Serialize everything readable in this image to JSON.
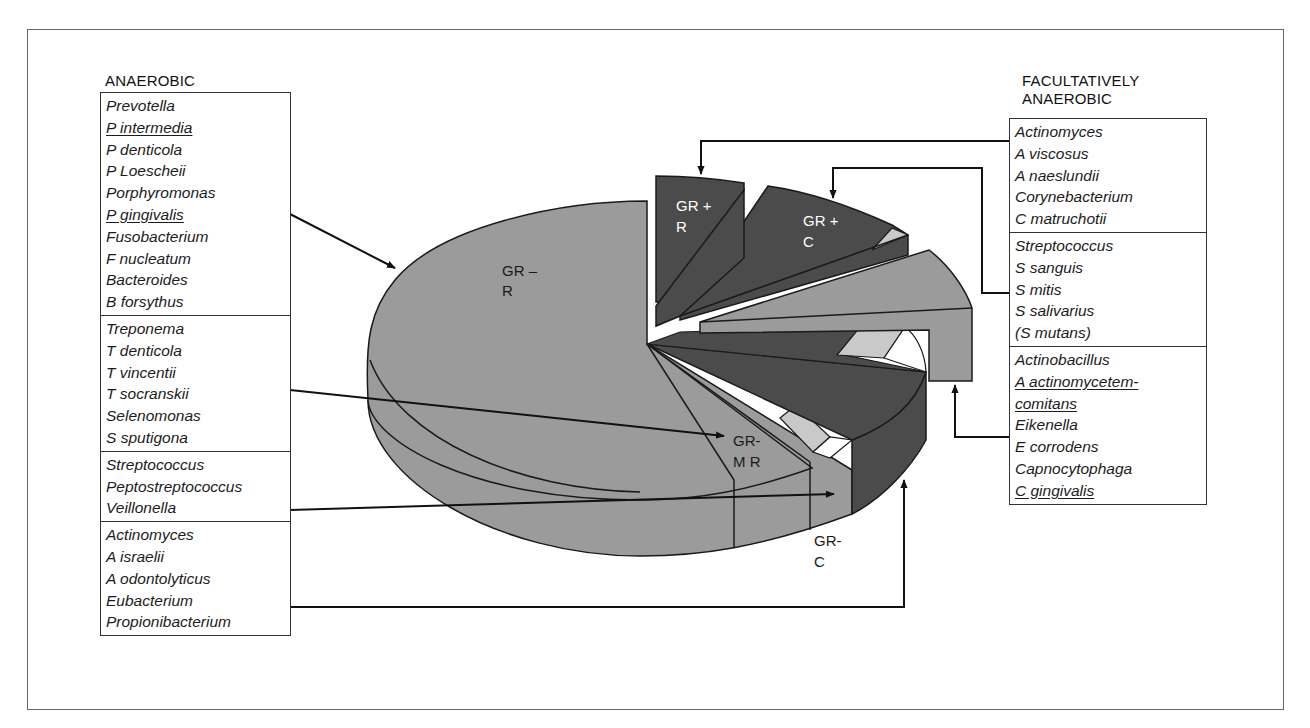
{
  "figure": {
    "anaerobic": {
      "heading": "ANAEROBIC",
      "groups": [
        {
          "items": [
            {
              "text": "Prevotella",
              "underline": false
            },
            {
              "text": "P intermedia",
              "underline": true
            },
            {
              "text": "P denticola",
              "underline": false
            },
            {
              "text": "P Loescheii",
              "underline": false
            },
            {
              "text": "Porphyromonas",
              "underline": false
            },
            {
              "text": "P gingivalis",
              "underline": true
            },
            {
              "text": "Fusobacterium",
              "underline": false
            },
            {
              "text": "F nucleatum",
              "underline": false
            },
            {
              "text": "Bacteroides",
              "underline": false
            },
            {
              "text": "B forsythus",
              "underline": false
            }
          ],
          "points_to": "GR - R"
        },
        {
          "items": [
            {
              "text": "Treponema",
              "underline": false
            },
            {
              "text": "T denticola",
              "underline": false
            },
            {
              "text": "T vincentii",
              "underline": false
            },
            {
              "text": "T socranskii",
              "underline": false
            },
            {
              "text": "Selenomonas",
              "underline": false
            },
            {
              "text": "S sputigona",
              "underline": false
            }
          ],
          "points_to": "GR- M R"
        },
        {
          "items": [
            {
              "text": "Streptococcus",
              "underline": false
            },
            {
              "text": "Peptostreptococcus",
              "underline": false
            },
            {
              "text": "Veillonella",
              "underline": false
            }
          ],
          "points_to": "GR- C"
        },
        {
          "items": [
            {
              "text": "Actinomyces",
              "underline": false
            },
            {
              "text": "A israelii",
              "underline": false
            },
            {
              "text": "A odontolyticus",
              "underline": false
            },
            {
              "text": "Eubacterium",
              "underline": false
            },
            {
              "text": "Propionibacterium",
              "underline": false
            }
          ],
          "points_to": "GR + R (anaerobic)"
        }
      ]
    },
    "facultative": {
      "heading_line1": "FACULTATIVELY",
      "heading_line2": "ANAEROBIC",
      "groups": [
        {
          "items": [
            {
              "text": "Actinomyces",
              "underline": false
            },
            {
              "text": "A viscosus",
              "underline": false
            },
            {
              "text": "A naeslundii",
              "underline": false
            },
            {
              "text": "Corynebacterium",
              "underline": false
            },
            {
              "text": "C matruchotii",
              "underline": false
            }
          ],
          "points_to": "GR + R"
        },
        {
          "items": [
            {
              "text": "Streptococcus",
              "underline": false
            },
            {
              "text": "S sanguis",
              "underline": false
            },
            {
              "text": "S mitis",
              "underline": false
            },
            {
              "text": "S salivarius",
              "underline": false
            },
            {
              "text": "(S mutans)",
              "underline": false
            }
          ],
          "points_to": "GR + C"
        },
        {
          "items": [
            {
              "text": "Actinobacillus",
              "underline": false
            },
            {
              "text": "A actinomycetem-",
              "underline": true
            },
            {
              "text": "comitans",
              "underline": true
            },
            {
              "text": "Eikenella",
              "underline": false
            },
            {
              "text": "E corrodens",
              "underline": false
            },
            {
              "text": "Capnocytophaga",
              "underline": false
            },
            {
              "text": "C gingivalis",
              "underline": true
            }
          ],
          "points_to": "GR- R (facultative)"
        }
      ]
    },
    "pie_labels": {
      "gr_neg_r_1": "GR –",
      "gr_neg_r_2": "R",
      "gr_pos_r_1": "GR +",
      "gr_pos_r_2": "R",
      "gr_pos_c_1": "GR +",
      "gr_pos_c_2": "C",
      "gr_neg_mr_1": "GR-",
      "gr_neg_mr_2": "M R",
      "gr_neg_c_1": "GR-",
      "gr_neg_c_2": "C"
    },
    "colors": {
      "main_grey": "#9b9b9b",
      "dark": "#4b4b4b",
      "light": "#c9c9c9",
      "outline": "#1a1a1a"
    }
  }
}
